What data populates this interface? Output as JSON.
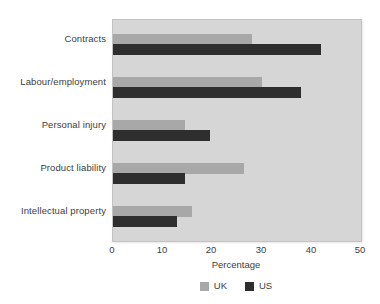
{
  "chart_data": {
    "type": "bar",
    "orientation": "horizontal",
    "title": "",
    "xlabel": "Percentage",
    "ylabel": "",
    "xlim": [
      0,
      50
    ],
    "xticks": [
      "0",
      "10",
      "20",
      "30",
      "40",
      "50"
    ],
    "grid": false,
    "legend_position": "bottom",
    "categories": [
      "Contracts",
      "Labour/employment",
      "Personal injury",
      "Product liability",
      "Intellectual property"
    ],
    "series": [
      {
        "name": "UK",
        "color": "#a8a8a8",
        "values": [
          28,
          30,
          14.5,
          26.5,
          16
        ]
      },
      {
        "name": "US",
        "color": "#2e2e2e",
        "values": [
          42,
          38,
          19.5,
          14.5,
          13
        ]
      }
    ]
  },
  "colors": {
    "plot_background": "#d6d6d6",
    "page_background": "#ffffff",
    "uk": "#a8a8a8",
    "us": "#2e2e2e",
    "text": "#3d3d3d"
  }
}
